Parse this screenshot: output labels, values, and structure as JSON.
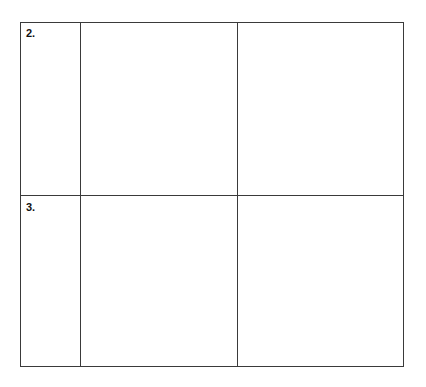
{
  "table": {
    "rows": [
      {
        "number": "2.",
        "cells": [
          "",
          ""
        ]
      },
      {
        "number": "3.",
        "cells": [
          "",
          ""
        ]
      }
    ],
    "border_color": "#3a3a3a"
  }
}
